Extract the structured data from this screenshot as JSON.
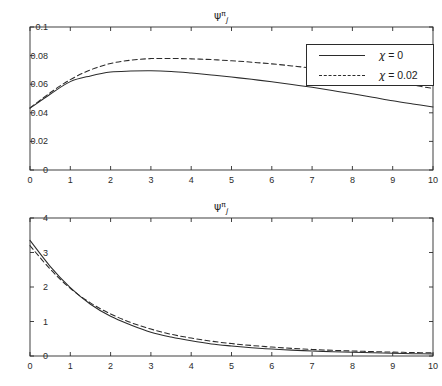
{
  "figure": {
    "background": "#ffffff",
    "axis_color": "#2b2b2b",
    "line_color": "#2b2b2b"
  },
  "titles": {
    "psi": "ψ",
    "subscript": "j",
    "superscript": "π"
  },
  "legend": {
    "series": [
      {
        "label_prefix": "χ",
        "label_rest": " = 0",
        "style": "solid"
      },
      {
        "label_prefix": "χ",
        "label_rest": " = 0.02",
        "style": "dashed"
      }
    ]
  },
  "chart_data": [
    {
      "type": "line",
      "id": "top",
      "title": "ψ_j^π",
      "xlabel": "",
      "ylabel": "",
      "xlim": [
        0,
        10
      ],
      "ylim": [
        0,
        0.1
      ],
      "xticks": [
        0,
        1,
        2,
        3,
        4,
        5,
        6,
        7,
        8,
        9,
        10
      ],
      "xticklabels": [
        "0",
        "1",
        "2",
        "3",
        "4",
        "5",
        "6",
        "7",
        "8",
        "9",
        "10"
      ],
      "yticks": [
        0,
        0.02,
        0.04,
        0.06,
        0.08,
        0.1
      ],
      "yticklabels": [
        "0",
        "0.02",
        "0.04",
        "0.06",
        "0.08",
        "0.1"
      ],
      "grid": false,
      "legend_position": "upper right",
      "x": [
        0,
        0.5,
        1,
        1.5,
        2,
        2.5,
        3,
        3.5,
        4,
        4.5,
        5,
        5.5,
        6,
        6.5,
        7,
        7.5,
        8,
        8.5,
        9,
        9.5,
        10
      ],
      "series": [
        {
          "name": "χ = 0",
          "style": "solid",
          "values": [
            0.0432,
            0.053,
            0.0618,
            0.0658,
            0.0685,
            0.0692,
            0.0694,
            0.0689,
            0.0678,
            0.0665,
            0.065,
            0.0634,
            0.0617,
            0.0598,
            0.0578,
            0.0556,
            0.0533,
            0.0509,
            0.0484,
            0.0462,
            0.0441
          ]
        },
        {
          "name": "χ = 0.02",
          "style": "dashed",
          "values": [
            0.0434,
            0.054,
            0.0632,
            0.07,
            0.0745,
            0.0768,
            0.0779,
            0.078,
            0.0777,
            0.0772,
            0.0764,
            0.0754,
            0.0742,
            0.0728,
            0.0712,
            0.0693,
            0.0671,
            0.0647,
            0.0621,
            0.0594,
            0.057
          ]
        }
      ]
    },
    {
      "type": "line",
      "id": "bottom",
      "title": "ψ_j^π",
      "xlabel": "",
      "ylabel": "",
      "xlim": [
        0,
        10
      ],
      "ylim": [
        0,
        4
      ],
      "xticks": [
        0,
        1,
        2,
        3,
        4,
        5,
        6,
        7,
        8,
        9,
        10
      ],
      "xticklabels": [
        "0",
        "1",
        "2",
        "3",
        "4",
        "5",
        "6",
        "7",
        "8",
        "9",
        "10"
      ],
      "yticks": [
        0,
        1,
        2,
        3,
        4
      ],
      "yticklabels": [
        "0",
        "1",
        "2",
        "3",
        "4"
      ],
      "grid": false,
      "legend_position": "upper right",
      "x": [
        0,
        0.5,
        1,
        1.5,
        2,
        2.5,
        3,
        3.5,
        4,
        4.5,
        5,
        5.5,
        6,
        6.5,
        7,
        7.5,
        8,
        8.5,
        9,
        9.5,
        10
      ],
      "series": [
        {
          "name": "χ = 0",
          "style": "solid",
          "values": [
            3.35,
            2.6,
            1.98,
            1.5,
            1.15,
            0.9,
            0.69,
            0.55,
            0.44,
            0.35,
            0.29,
            0.24,
            0.2,
            0.17,
            0.145,
            0.125,
            0.108,
            0.093,
            0.08,
            0.068,
            0.058
          ]
        },
        {
          "name": "χ = 0.02",
          "style": "dashed",
          "values": [
            3.2,
            2.52,
            1.96,
            1.54,
            1.22,
            0.97,
            0.78,
            0.63,
            0.52,
            0.43,
            0.36,
            0.305,
            0.258,
            0.22,
            0.19,
            0.165,
            0.145,
            0.128,
            0.113,
            0.1,
            0.09
          ]
        }
      ]
    }
  ]
}
